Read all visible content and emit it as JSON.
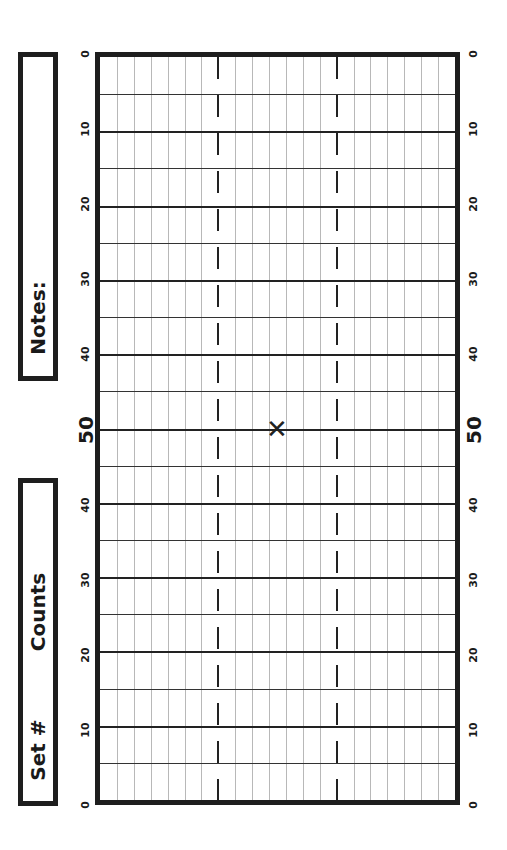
{
  "notes_box": {
    "label": "Notes:"
  },
  "set_box": {
    "set_label": "Set #",
    "counts_label": "Counts"
  },
  "field": {
    "midfield_label": "50",
    "left_numbers": [
      "0",
      "10",
      "20",
      "30",
      "40",
      "50",
      "40",
      "30",
      "20",
      "10",
      "0"
    ],
    "right_numbers": [
      "0",
      "10",
      "20",
      "30",
      "40",
      "50",
      "40",
      "30",
      "20",
      "10",
      "0"
    ],
    "center_mark": "✕",
    "columns": 21,
    "hash_columns": [
      7,
      14
    ],
    "line_color": "#222222",
    "grid_color": "#b8b8b8"
  }
}
